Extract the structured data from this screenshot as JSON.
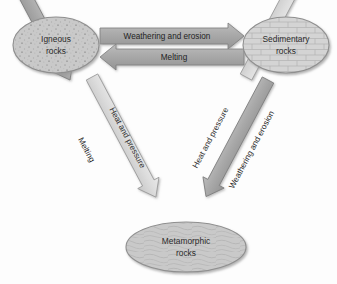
{
  "diagram": {
    "background_color": "#fdfdfd",
    "nodes": [
      {
        "id": "igneous",
        "label_line1": "Igneous",
        "label_line2": "rocks",
        "texture": "speckled-stipple",
        "fill_color": "#c9c9c9",
        "stroke_color": "#8f8f8f",
        "cx": 56,
        "cy": 45,
        "rx": 43,
        "ry": 28
      },
      {
        "id": "sedimentary",
        "label_line1": "Sedimentary",
        "label_line2": "rocks",
        "texture": "brick-masonry",
        "fill_color": "#d2d2d2",
        "stroke_color": "#8f8f8f",
        "cx": 286,
        "cy": 45,
        "rx": 43,
        "ry": 28
      },
      {
        "id": "metamorphic",
        "label_line1": "Metamorphic",
        "label_line2": "rocks",
        "texture": "swirl-foliated",
        "fill_color": "#c9c9c9",
        "stroke_color": "#8f8f8f",
        "cx": 186,
        "cy": 247,
        "rx": 60,
        "ry": 25
      }
    ],
    "arrows": [
      {
        "id": "weathering-top",
        "label": "Weathering and erosion",
        "from": "igneous",
        "to": "sedimentary",
        "direction": "right",
        "shade": "dark",
        "fill_color": "#a9a9a9",
        "stroke_color": "#7d7d7d"
      },
      {
        "id": "melting-top",
        "label": "Melting",
        "from": "sedimentary",
        "to": "igneous",
        "direction": "left",
        "shade": "dark",
        "fill_color": "#a9a9a9",
        "stroke_color": "#7d7d7d"
      },
      {
        "id": "melting-left",
        "label": "Melting",
        "from": "metamorphic",
        "to": "igneous",
        "direction": "up-left",
        "shade": "dark",
        "fill_color": "#a9a9a9",
        "stroke_color": "#7d7d7d"
      },
      {
        "id": "heat-pressure-left",
        "label": "Heat and pressure",
        "from": "igneous",
        "to": "metamorphic",
        "direction": "down-right",
        "shade": "light",
        "fill_color": "#dcdcdc",
        "stroke_color": "#9a9a9a"
      },
      {
        "id": "heat-pressure-right",
        "label": "Heat and pressure",
        "from": "sedimentary",
        "to": "metamorphic",
        "direction": "down-left",
        "shade": "light",
        "fill_color": "#dcdcdc",
        "stroke_color": "#9a9a9a"
      },
      {
        "id": "weathering-right",
        "label": "Weathering and erosion",
        "from": "metamorphic",
        "to": "sedimentary",
        "direction": "up-right",
        "shade": "dark",
        "fill_color": "#a9a9a9",
        "stroke_color": "#7d7d7d"
      }
    ]
  }
}
